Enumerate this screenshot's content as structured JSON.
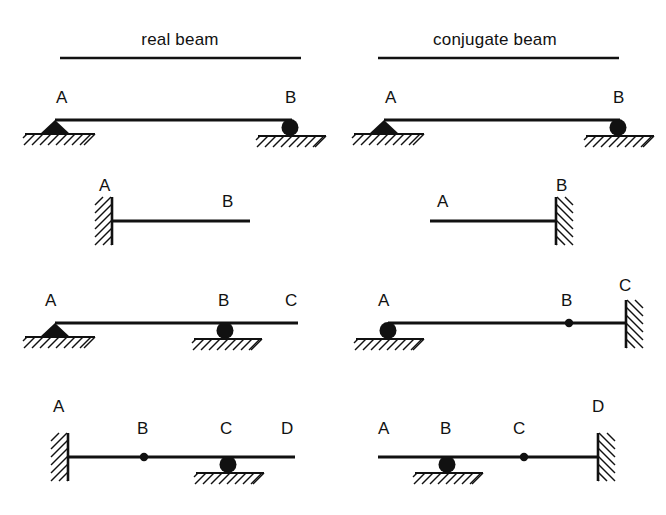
{
  "figure": {
    "background_color": "#ffffff",
    "ink_color": "#111111",
    "columns": [
      {
        "id": "real",
        "title": "real beam",
        "title_x": 180,
        "title_y": 42,
        "rule": {
          "x1": 60,
          "x2": 301,
          "y": 58
        }
      },
      {
        "id": "conjugate",
        "title": "conjugate beam",
        "title_x": 495,
        "title_y": 42,
        "rule": {
          "x1": 378,
          "x2": 619,
          "y": 58
        }
      }
    ],
    "rows": [
      {
        "id": "row-1",
        "description": "simply supported beam",
        "real": {
          "beam": {
            "x1": 55,
            "x2": 292,
            "y": 120
          },
          "labels": [
            {
              "text": "A",
              "x": 56,
              "y": 103
            },
            {
              "text": "B",
              "x": 285,
              "y": 103
            }
          ],
          "supports": [
            {
              "type": "pin",
              "x": 55,
              "y": 120,
              "ground_x1": 25,
              "ground_x2": 95
            },
            {
              "type": "roller",
              "x": 290,
              "y": 120,
              "ground_x1": 258,
              "ground_x2": 326
            }
          ]
        },
        "conjugate": {
          "beam": {
            "x1": 384,
            "x2": 620,
            "y": 120
          },
          "labels": [
            {
              "text": "A",
              "x": 385,
              "y": 103
            },
            {
              "text": "B",
              "x": 613,
              "y": 103
            }
          ],
          "supports": [
            {
              "type": "pin",
              "x": 384,
              "y": 120,
              "ground_x1": 354,
              "ground_x2": 424
            },
            {
              "type": "roller",
              "x": 618,
              "y": 120,
              "ground_x1": 586,
              "ground_x2": 654
            }
          ]
        }
      },
      {
        "id": "row-2",
        "description": "cantilever beam",
        "real": {
          "beam": {
            "x1": 112,
            "x2": 250,
            "y": 221
          },
          "labels": [
            {
              "text": "A",
              "x": 99,
              "y": 191
            },
            {
              "text": "B",
              "x": 222,
              "y": 207
            }
          ],
          "supports": [
            {
              "type": "fixed-left",
              "x": 112,
              "y1": 197,
              "y2": 245
            },
            {
              "type": "free",
              "x": 250,
              "y": 221
            }
          ]
        },
        "conjugate": {
          "beam": {
            "x1": 430,
            "x2": 556,
            "y": 221
          },
          "labels": [
            {
              "text": "A",
              "x": 437,
              "y": 207
            },
            {
              "text": "B",
              "x": 556,
              "y": 191
            }
          ],
          "supports": [
            {
              "type": "free",
              "x": 430,
              "y": 221
            },
            {
              "type": "fixed-right",
              "x": 556,
              "y1": 197,
              "y2": 245
            }
          ]
        }
      },
      {
        "id": "row-3",
        "description": "beam with overhang",
        "real": {
          "beam": {
            "x1": 55,
            "x2": 298,
            "y": 323
          },
          "labels": [
            {
              "text": "A",
              "x": 45,
              "y": 306
            },
            {
              "text": "B",
              "x": 218,
              "y": 306
            },
            {
              "text": "C",
              "x": 285,
              "y": 306
            }
          ],
          "supports": [
            {
              "type": "pin",
              "x": 55,
              "y": 323,
              "ground_x1": 25,
              "ground_x2": 95
            },
            {
              "type": "roller",
              "x": 225,
              "y": 323,
              "ground_x1": 194,
              "ground_x2": 262
            },
            {
              "type": "free",
              "x": 298,
              "y": 323
            }
          ]
        },
        "conjugate": {
          "beam": {
            "x1": 388,
            "x2": 626,
            "y": 323
          },
          "labels": [
            {
              "text": "A",
              "x": 378,
              "y": 306
            },
            {
              "text": "B",
              "x": 561,
              "y": 306
            },
            {
              "text": "C",
              "x": 619,
              "y": 291
            }
          ],
          "supports": [
            {
              "type": "roller",
              "x": 388,
              "y": 323,
              "ground_x1": 356,
              "ground_x2": 424
            },
            {
              "type": "hinge",
              "x": 569,
              "y": 323
            },
            {
              "type": "fixed-right",
              "x": 626,
              "y1": 300,
              "y2": 348
            }
          ]
        }
      },
      {
        "id": "row-4",
        "description": "beam with internal hinge",
        "real": {
          "beam": {
            "x1": 68,
            "x2": 295,
            "y": 457
          },
          "labels": [
            {
              "text": "A",
              "x": 53,
              "y": 412
            },
            {
              "text": "B",
              "x": 137,
              "y": 434
            },
            {
              "text": "C",
              "x": 220,
              "y": 434
            },
            {
              "text": "D",
              "x": 281,
              "y": 434
            }
          ],
          "supports": [
            {
              "type": "fixed-left",
              "x": 68,
              "y1": 433,
              "y2": 481
            },
            {
              "type": "hinge",
              "x": 144,
              "y": 457
            },
            {
              "type": "roller",
              "x": 228,
              "y": 457,
              "ground_x1": 196,
              "ground_x2": 264
            },
            {
              "type": "free",
              "x": 295,
              "y": 457
            }
          ]
        },
        "conjugate": {
          "beam": {
            "x1": 378,
            "x2": 598,
            "y": 457
          },
          "labels": [
            {
              "text": "A",
              "x": 378,
              "y": 434
            },
            {
              "text": "B",
              "x": 440,
              "y": 434
            },
            {
              "text": "C",
              "x": 513,
              "y": 434
            },
            {
              "text": "D",
              "x": 592,
              "y": 412
            }
          ],
          "supports": [
            {
              "type": "free",
              "x": 378,
              "y": 457
            },
            {
              "type": "roller",
              "x": 447,
              "y": 457,
              "ground_x1": 415,
              "ground_x2": 483
            },
            {
              "type": "hinge",
              "x": 524,
              "y": 457
            },
            {
              "type": "fixed-right",
              "x": 598,
              "y1": 433,
              "y2": 481
            }
          ]
        }
      }
    ]
  }
}
